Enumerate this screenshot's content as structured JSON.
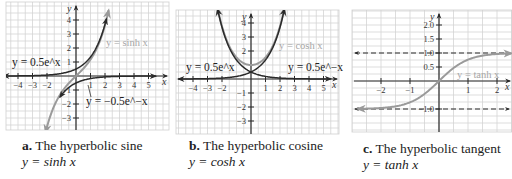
{
  "chart_data": [
    {
      "type": "line",
      "id": "a",
      "title": "The hyperbolic sine",
      "caption_letter": "a.",
      "caption_equation": "y = sinh x",
      "xlabel": "x",
      "ylabel": "y",
      "xlim": [
        -5,
        5.5
      ],
      "ylim": [
        -3.6,
        4.8
      ],
      "xticks": [
        -4,
        -3,
        -2,
        1,
        2,
        3,
        4,
        5
      ],
      "yticks": [
        -3,
        -2,
        -1,
        1,
        2,
        3,
        4
      ],
      "grid": true,
      "series": [
        {
          "name": "y = sinh x",
          "func": "sinh",
          "color": "#9a9a9a",
          "label": "y = sinh x",
          "xrange": [
            -2.1,
            2.25
          ]
        },
        {
          "name": "y = 0.5e^x",
          "func": "half_exp",
          "color": "#2a2a2a",
          "label": "y = 0.5e^x",
          "xrange": [
            -5,
            2.1
          ]
        },
        {
          "name": "y = -0.5e^-x",
          "func": "neg_half_exp_neg",
          "color": "#2a2a2a",
          "label": "y = −0.5e^−x",
          "xrange": [
            -1.1,
            5.5
          ]
        }
      ]
    },
    {
      "type": "line",
      "id": "b",
      "title": "The hyperbolic cosine",
      "caption_letter": "b.",
      "caption_equation": "y = cosh x",
      "xlabel": "x",
      "ylabel": "y",
      "xlim": [
        -5,
        5.5
      ],
      "ylim": [
        -3.6,
        4.8
      ],
      "xticks": [
        -4,
        -3,
        -2,
        1,
        2,
        3,
        4,
        5
      ],
      "yticks": [
        -3,
        -2,
        -1,
        2,
        3,
        4
      ],
      "grid": true,
      "series": [
        {
          "name": "y = cosh x",
          "func": "cosh",
          "color": "#9a9a9a",
          "label": "y = cosh x",
          "xrange": [
            -2.3,
            2.3
          ]
        },
        {
          "name": "y = 0.5e^x",
          "func": "half_exp",
          "color": "#2a2a2a",
          "label": "y = 0.5e^x",
          "xrange": [
            -5,
            2.3
          ]
        },
        {
          "name": "y = 0.5e^-x",
          "func": "half_exp_neg",
          "color": "#2a2a2a",
          "label": "y = 0.5e^−x",
          "xrange": [
            -2.3,
            5.5
          ]
        }
      ]
    },
    {
      "type": "line",
      "id": "c",
      "title": "The hyperbolic tangent",
      "caption_letter": "c.",
      "caption_equation": "y = tanh x",
      "xlabel": "x",
      "ylabel": "y",
      "xlim": [
        -2.8,
        2.5
      ],
      "ylim": [
        -1.5,
        2.3
      ],
      "xticks": [
        -2,
        -1,
        1,
        2
      ],
      "yticks": [
        -1.0,
        0.5,
        1.0,
        1.5,
        2.0
      ],
      "ytick_labels": [
        "−1.0",
        "0.5",
        "1.0",
        "1.5",
        "2.0"
      ],
      "grid": true,
      "asymptotes": [
        1.0,
        -1.0
      ],
      "series": [
        {
          "name": "y = tanh x",
          "func": "tanh",
          "color": "#9a9a9a",
          "label": "y = tanh x",
          "xrange": [
            -2.8,
            2.5
          ]
        }
      ]
    }
  ]
}
